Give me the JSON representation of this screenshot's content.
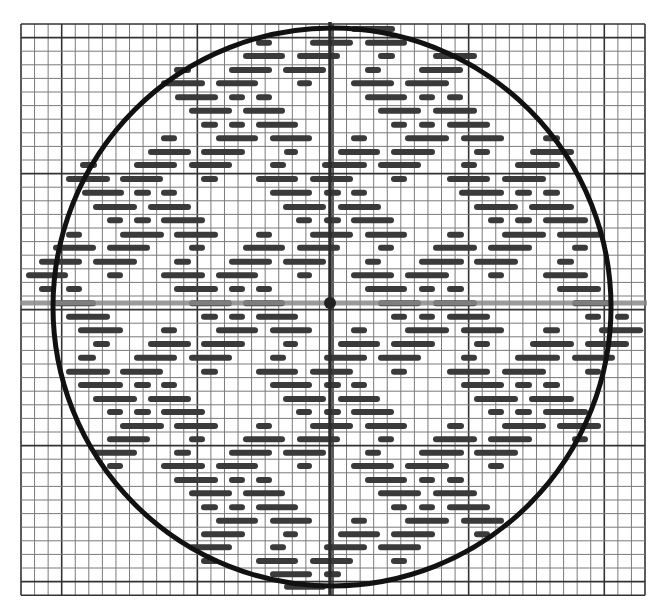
{
  "figure": {
    "width": 659,
    "height": 611,
    "background": "#ffffff",
    "grid": {
      "x0": 21,
      "y0": 24,
      "cols": 46,
      "rows": 42,
      "cell_w": 13.565,
      "cell_h": 13.6,
      "minor_color": "#7a7a7a",
      "major_color": "#333333",
      "major_cols": [
        3,
        13,
        23,
        33,
        43
      ],
      "major_rows": [
        1,
        11,
        21,
        31,
        41
      ]
    },
    "axes": {
      "horizontal": {
        "y": 303,
        "x1": 20,
        "x2": 647,
        "color": "#8a8a8a",
        "width": 5
      },
      "vertical": {
        "x": 330,
        "y1": 22,
        "y2": 595,
        "color": "#2a2a2a",
        "width": 3.5
      },
      "center_dot": {
        "x": 330,
        "y": 303,
        "r": 6,
        "color": "#222222"
      }
    },
    "circle": {
      "cx": 332,
      "cy": 307,
      "r": 279,
      "color": "#111111",
      "width": 5
    },
    "dash_color": "#3a3a3a",
    "dash_thickness": 6,
    "dash_rows": [
      {
        "y": 29,
        "segments": [
          [
            351,
            395
          ]
        ]
      },
      {
        "y": 42.7,
        "segments": [
          [
            256,
            272
          ],
          [
            310,
            353
          ],
          [
            365,
            407
          ]
        ]
      },
      {
        "y": 56,
        "segments": [
          [
            243,
            285
          ],
          [
            297,
            340
          ],
          [
            378,
            395
          ],
          [
            433,
            477
          ]
        ]
      },
      {
        "y": 70,
        "segments": [
          [
            174,
            191
          ],
          [
            229,
            272
          ],
          [
            283,
            326
          ],
          [
            365,
            381
          ],
          [
            419,
            463
          ]
        ]
      },
      {
        "y": 83.3,
        "segments": [
          [
            161,
            205
          ],
          [
            216,
            258
          ],
          [
            297,
            312
          ],
          [
            351,
            394
          ],
          [
            405,
            449
          ]
        ]
      },
      {
        "y": 97.3,
        "segments": [
          [
            175,
            218
          ],
          [
            229,
            245
          ],
          [
            256,
            272
          ],
          [
            365,
            407
          ],
          [
            419,
            435
          ],
          [
            447,
            463
          ]
        ]
      },
      {
        "y": 110.7,
        "segments": [
          [
            189,
            232
          ],
          [
            243,
            285
          ],
          [
            378,
            421
          ],
          [
            433,
            477
          ]
        ]
      },
      {
        "y": 124.7,
        "segments": [
          [
            201,
            218
          ],
          [
            229,
            245
          ],
          [
            256,
            298
          ],
          [
            391,
            407
          ],
          [
            419,
            435
          ],
          [
            447,
            490
          ]
        ]
      },
      {
        "y": 138.3,
        "segments": [
          [
            161,
            177
          ],
          [
            216,
            258
          ],
          [
            270,
            312
          ],
          [
            351,
            367
          ],
          [
            405,
            449
          ],
          [
            461,
            504
          ],
          [
            543,
            560
          ]
        ]
      },
      {
        "y": 152,
        "segments": [
          [
            148,
            191
          ],
          [
            201,
            245
          ],
          [
            284,
            298
          ],
          [
            338,
            380
          ],
          [
            391,
            435
          ],
          [
            474,
            490
          ],
          [
            530,
            574
          ]
        ]
      },
      {
        "y": 165,
        "segments": [
          [
            80,
            97
          ],
          [
            134,
            177
          ],
          [
            189,
            232
          ],
          [
            270,
            286
          ],
          [
            322,
            367
          ],
          [
            378,
            421
          ],
          [
            461,
            477
          ],
          [
            515,
            560
          ]
        ]
      },
      {
        "y": 179,
        "segments": [
          [
            66,
            110
          ],
          [
            120,
            163
          ],
          [
            201,
            218
          ],
          [
            256,
            298
          ],
          [
            310,
            353
          ],
          [
            391,
            407
          ],
          [
            447,
            490
          ],
          [
            502,
            546
          ]
        ]
      },
      {
        "y": 192.7,
        "segments": [
          [
            82,
            124
          ],
          [
            134,
            151
          ],
          [
            161,
            177
          ],
          [
            270,
            312
          ],
          [
            324,
            341
          ],
          [
            351,
            367
          ],
          [
            459,
            504
          ],
          [
            515,
            532
          ],
          [
            543,
            560
          ]
        ]
      },
      {
        "y": 207,
        "segments": [
          [
            93,
            137
          ],
          [
            148,
            191
          ],
          [
            283,
            326
          ],
          [
            338,
            381
          ],
          [
            474,
            518
          ],
          [
            529,
            574
          ]
        ]
      },
      {
        "y": 220.3,
        "segments": [
          [
            107,
            123
          ],
          [
            134,
            151
          ],
          [
            161,
            205
          ],
          [
            296,
            312
          ],
          [
            324,
            341
          ],
          [
            351,
            394
          ],
          [
            488,
            504
          ],
          [
            515,
            532
          ],
          [
            543,
            588
          ]
        ]
      },
      {
        "y": 234.7,
        "segments": [
          [
            66,
            82
          ],
          [
            120,
            164
          ],
          [
            174,
            218
          ],
          [
            256,
            272
          ],
          [
            310,
            353
          ],
          [
            365,
            407
          ],
          [
            447,
            464
          ],
          [
            502,
            546
          ],
          [
            557,
            601
          ]
        ]
      },
      {
        "y": 247.7,
        "segments": [
          [
            53,
            96
          ],
          [
            107,
            150
          ],
          [
            189,
            205
          ],
          [
            243,
            285
          ],
          [
            297,
            340
          ],
          [
            378,
            394
          ],
          [
            433,
            477
          ],
          [
            488,
            532
          ],
          [
            572,
            588
          ]
        ]
      },
      {
        "y": 261.7,
        "segments": [
          [
            39,
            82
          ],
          [
            93,
            137
          ],
          [
            174,
            191
          ],
          [
            229,
            272
          ],
          [
            283,
            326
          ],
          [
            365,
            381
          ],
          [
            419,
            464
          ],
          [
            474,
            518
          ],
          [
            557,
            574
          ]
        ]
      },
      {
        "y": 275.3,
        "segments": [
          [
            26,
            68
          ],
          [
            107,
            123
          ],
          [
            161,
            205
          ],
          [
            216,
            258
          ],
          [
            297,
            312
          ],
          [
            351,
            394
          ],
          [
            405,
            449
          ],
          [
            488,
            504
          ],
          [
            543,
            588
          ]
        ]
      },
      {
        "y": 289,
        "segments": [
          [
            39,
            53
          ],
          [
            66,
            82
          ],
          [
            174,
            218
          ],
          [
            229,
            245
          ],
          [
            256,
            272
          ],
          [
            365,
            407
          ],
          [
            419,
            435
          ],
          [
            447,
            464
          ],
          [
            557,
            601
          ]
        ]
      },
      {
        "y": 303.3,
        "segments": [
          [
            53,
            96
          ],
          [
            189,
            232
          ],
          [
            243,
            285
          ],
          [
            378,
            421
          ],
          [
            433,
            477
          ],
          [
            572,
            613
          ]
        ]
      },
      {
        "y": 316.7,
        "segments": [
          [
            66,
            110
          ],
          [
            201,
            218
          ],
          [
            229,
            245
          ],
          [
            256,
            298
          ],
          [
            391,
            407
          ],
          [
            419,
            435
          ],
          [
            447,
            490
          ],
          [
            585,
            601
          ],
          [
            615,
            629
          ]
        ]
      },
      {
        "y": 330.3,
        "segments": [
          [
            78,
            123
          ],
          [
            161,
            177
          ],
          [
            216,
            258
          ],
          [
            270,
            312
          ],
          [
            351,
            367
          ],
          [
            405,
            449
          ],
          [
            461,
            504
          ],
          [
            543,
            560
          ],
          [
            599,
            643
          ]
        ]
      },
      {
        "y": 344,
        "segments": [
          [
            93,
            110
          ],
          [
            148,
            191
          ],
          [
            201,
            245
          ],
          [
            283,
            298
          ],
          [
            338,
            380
          ],
          [
            391,
            435
          ],
          [
            474,
            490
          ],
          [
            530,
            574
          ],
          [
            585,
            629
          ]
        ]
      },
      {
        "y": 357.7,
        "segments": [
          [
            78,
            96
          ],
          [
            134,
            177
          ],
          [
            189,
            232
          ],
          [
            270,
            286
          ],
          [
            324,
            367
          ],
          [
            378,
            421
          ],
          [
            461,
            477
          ],
          [
            515,
            560
          ],
          [
            572,
            615
          ]
        ]
      },
      {
        "y": 371.7,
        "segments": [
          [
            66,
            110
          ],
          [
            120,
            163
          ],
          [
            201,
            218
          ],
          [
            256,
            298
          ],
          [
            310,
            353
          ],
          [
            391,
            407
          ],
          [
            447,
            490
          ],
          [
            502,
            546
          ],
          [
            585,
            601
          ]
        ]
      },
      {
        "y": 385,
        "segments": [
          [
            78,
            123
          ],
          [
            134,
            151
          ],
          [
            161,
            177
          ],
          [
            270,
            312
          ],
          [
            324,
            341
          ],
          [
            351,
            367
          ],
          [
            461,
            504
          ],
          [
            515,
            532
          ],
          [
            543,
            560
          ]
        ]
      },
      {
        "y": 399,
        "segments": [
          [
            93,
            137
          ],
          [
            148,
            191
          ],
          [
            283,
            326
          ],
          [
            338,
            380
          ],
          [
            474,
            518
          ],
          [
            529,
            574
          ]
        ]
      },
      {
        "y": 412,
        "segments": [
          [
            107,
            123
          ],
          [
            134,
            151
          ],
          [
            161,
            205
          ],
          [
            296,
            312
          ],
          [
            324,
            341
          ],
          [
            351,
            394
          ],
          [
            488,
            504
          ],
          [
            515,
            532
          ],
          [
            543,
            588
          ]
        ]
      },
      {
        "y": 426,
        "segments": [
          [
            120,
            164
          ],
          [
            174,
            218
          ],
          [
            256,
            272
          ],
          [
            310,
            353
          ],
          [
            365,
            407
          ],
          [
            447,
            464
          ],
          [
            502,
            546
          ],
          [
            557,
            601
          ]
        ]
      },
      {
        "y": 439.3,
        "segments": [
          [
            107,
            150
          ],
          [
            189,
            205
          ],
          [
            243,
            285
          ],
          [
            297,
            340
          ],
          [
            378,
            394
          ],
          [
            433,
            477
          ],
          [
            488,
            532
          ],
          [
            572,
            588
          ]
        ]
      },
      {
        "y": 452.7,
        "segments": [
          [
            93,
            137
          ],
          [
            174,
            191
          ],
          [
            229,
            272
          ],
          [
            283,
            326
          ],
          [
            365,
            381
          ],
          [
            419,
            464
          ],
          [
            474,
            518
          ]
        ]
      },
      {
        "y": 466,
        "segments": [
          [
            107,
            123
          ],
          [
            161,
            205
          ],
          [
            216,
            258
          ],
          [
            297,
            312
          ],
          [
            351,
            394
          ],
          [
            405,
            449
          ],
          [
            488,
            504
          ]
        ]
      },
      {
        "y": 480,
        "segments": [
          [
            174,
            218
          ],
          [
            229,
            245
          ],
          [
            256,
            272
          ],
          [
            365,
            407
          ],
          [
            419,
            435
          ],
          [
            447,
            464
          ]
        ]
      },
      {
        "y": 493.3,
        "segments": [
          [
            189,
            232
          ],
          [
            243,
            285
          ],
          [
            378,
            421
          ],
          [
            433,
            477
          ]
        ]
      },
      {
        "y": 507.3,
        "segments": [
          [
            201,
            218
          ],
          [
            229,
            245
          ],
          [
            256,
            298
          ],
          [
            391,
            407
          ],
          [
            419,
            435
          ],
          [
            447,
            490
          ]
        ]
      },
      {
        "y": 520.7,
        "segments": [
          [
            216,
            258
          ],
          [
            270,
            312
          ],
          [
            351,
            367
          ],
          [
            405,
            449
          ],
          [
            461,
            504
          ]
        ]
      },
      {
        "y": 534.3,
        "segments": [
          [
            201,
            245
          ],
          [
            283,
            298
          ],
          [
            338,
            380
          ],
          [
            391,
            435
          ],
          [
            474,
            490
          ]
        ]
      },
      {
        "y": 547.3,
        "segments": [
          [
            189,
            232
          ],
          [
            270,
            286
          ],
          [
            324,
            367
          ],
          [
            378,
            421
          ]
        ]
      },
      {
        "y": 561,
        "segments": [
          [
            201,
            218
          ],
          [
            256,
            298
          ],
          [
            310,
            353
          ],
          [
            391,
            407
          ]
        ]
      },
      {
        "y": 574.3,
        "segments": [
          [
            270,
            312
          ],
          [
            324,
            341
          ]
        ]
      },
      {
        "y": 586.7,
        "segments": [
          [
            284,
            326
          ]
        ]
      }
    ]
  }
}
